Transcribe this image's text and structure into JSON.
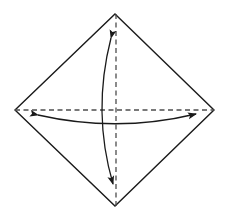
{
  "figure": {
    "title": "Rhombus with dashed diagonals and curved double-headed arrows",
    "background_color": "#ffffff",
    "canvas": {
      "width": 229,
      "height": 219
    }
  },
  "chart_data": {
    "type": "diagram",
    "title": "Rhombus with dashed diagonals and curved double-headed arrows",
    "shapes": [
      {
        "name": "rhombus-outline",
        "kind": "polygon",
        "stroke": "#1a1a1a",
        "stroke_width": 1.4,
        "fill": "none",
        "points": [
          {
            "label": "top-vertex",
            "x": 115,
            "y": 14
          },
          {
            "label": "right-vertex",
            "x": 214,
            "y": 110
          },
          {
            "label": "bottom-vertex",
            "x": 115,
            "y": 206
          },
          {
            "label": "left-vertex",
            "x": 15,
            "y": 110
          }
        ]
      },
      {
        "name": "vertical-diagonal",
        "kind": "dashed-line",
        "stroke": "#4d4d4d",
        "stroke_width": 1.3,
        "dash": "5,3.5",
        "from": {
          "x": 116,
          "y": 14
        },
        "to": {
          "x": 116,
          "y": 206
        }
      },
      {
        "name": "horizontal-diagonal",
        "kind": "dashed-line",
        "stroke": "#4d4d4d",
        "stroke_width": 1.3,
        "dash": "5,3.5",
        "from": {
          "x": 15,
          "y": 110
        },
        "to": {
          "x": 214,
          "y": 110
        }
      },
      {
        "name": "vertical-curved-arrow",
        "kind": "curved-double-arrow",
        "stroke": "#1a1a1a",
        "stroke_width": 1.3,
        "bulge_direction": "left",
        "start": {
          "x": 111,
          "y": 38
        },
        "control": {
          "x": 92,
          "y": 112
        },
        "end": {
          "x": 113,
          "y": 184
        },
        "arrowheads": [
          "start",
          "end"
        ]
      },
      {
        "name": "horizontal-curved-arrow",
        "kind": "curved-double-arrow",
        "stroke": "#1a1a1a",
        "stroke_width": 1.3,
        "bulge_direction": "down",
        "start": {
          "x": 38,
          "y": 115
        },
        "control": {
          "x": 117,
          "y": 133
        },
        "end": {
          "x": 196,
          "y": 114
        },
        "arrowheads": [
          "start",
          "end"
        ]
      }
    ],
    "center": {
      "x": 116,
      "y": 110
    },
    "colors": {
      "outline": "#1a1a1a",
      "dashed": "#4d4d4d",
      "arrow": "#1a1a1a",
      "background": "#ffffff"
    },
    "legend": [],
    "annotations": []
  }
}
